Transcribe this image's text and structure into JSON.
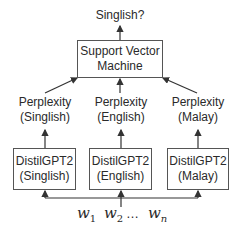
{
  "diagram": {
    "output_label": "Singlish?",
    "classifier": {
      "line1": "Support Vector",
      "line2": "Machine"
    },
    "perplexities": [
      {
        "line1": "Perplexity",
        "line2": "(Singlish)"
      },
      {
        "line1": "Perplexity",
        "line2": "(English)"
      },
      {
        "line1": "Perplexity",
        "line2": "(Malay)"
      }
    ],
    "models": [
      {
        "line1": "DistilGPT2",
        "line2": "(Singlish)"
      },
      {
        "line1": "DistilGPT2",
        "line2": "(English)"
      },
      {
        "line1": "DistilGPT2",
        "line2": "(Malay)"
      }
    ],
    "input": {
      "w1": "w",
      "w1_sub": "1",
      "w2": "w",
      "w2_sub": "2",
      "ellipsis": "…",
      "wn": "w",
      "wn_sub": "n"
    },
    "colors": {
      "line": "#333333",
      "box_border": "#555555"
    }
  }
}
